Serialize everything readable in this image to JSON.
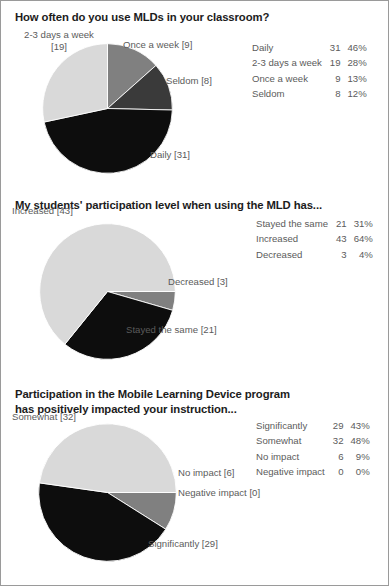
{
  "page": {
    "background": "#ffffff",
    "border_color": "#9a9a9a"
  },
  "palette": {
    "black": "#0d0d0d",
    "dark_gray": "#3a3a3a",
    "mid_gray": "#808080",
    "light_gray": "#d9d9d9",
    "slice_edge": "#ffffff",
    "title_color": "#1c1c1c",
    "label_color": "#5b5b5b"
  },
  "sections": [
    {
      "id": "section-0",
      "title": "How often do you use MLDs in your classroom?",
      "labels": [
        {
          "id": "lbl-0-0",
          "text": "Once a week  [9]",
          "align": "c-right"
        },
        {
          "id": "lbl-0-1",
          "text": "Seldom  [8]",
          "align": "c-right"
        },
        {
          "id": "lbl-0-2",
          "text": "Daily [31]",
          "align": "c-right"
        },
        {
          "id": "lbl-0-3",
          "text": "2-3 days a week\n[19]",
          "align": "c-center"
        }
      ],
      "table": {
        "rows": [
          {
            "label": "Daily",
            "count": "31",
            "percent": "46%"
          },
          {
            "label": "2-3 days a week",
            "count": "19",
            "percent": "28%"
          },
          {
            "label": "Once a week",
            "count": "9",
            "percent": "13%"
          },
          {
            "label": "Seldom",
            "count": "8",
            "percent": "12%"
          }
        ]
      }
    },
    {
      "id": "section-1",
      "title": "My students' participation level when using the MLD has...",
      "labels": [
        {
          "id": "lbl-1-0",
          "text": "Increased [43]",
          "align": "c-left"
        },
        {
          "id": "lbl-1-1",
          "text": "Decreased  [3]",
          "align": "c-right"
        },
        {
          "id": "lbl-1-2",
          "text": "Stayed the same  [21]",
          "align": "c-right"
        }
      ],
      "table": {
        "rows": [
          {
            "label": "Stayed the same",
            "count": "21",
            "percent": "31%"
          },
          {
            "label": "Increased",
            "count": "43",
            "percent": "64%"
          },
          {
            "label": "Decreased",
            "count": "3",
            "percent": "4%"
          }
        ]
      }
    },
    {
      "id": "section-2",
      "title": "Participation in the Mobile Learning Device program\nhas positively impacted your instruction...",
      "labels": [
        {
          "id": "lbl-2-0",
          "text": "Somewhat [32]",
          "align": "c-left"
        },
        {
          "id": "lbl-2-1",
          "text": "No impact  [6]",
          "align": "c-right"
        },
        {
          "id": "lbl-2-2",
          "text": "Negative impact  [0]",
          "align": "c-right"
        },
        {
          "id": "lbl-2-3",
          "text": "Significantly  [29]",
          "align": "c-right"
        }
      ],
      "table": {
        "rows": [
          {
            "label": "Significantly",
            "count": "29",
            "percent": "43%"
          },
          {
            "label": "Somewhat",
            "count": "32",
            "percent": "48%"
          },
          {
            "label": "No impact",
            "count": "6",
            "percent": "9%"
          },
          {
            "label": "Negative impact",
            "count": "0",
            "percent": "0%"
          }
        ]
      }
    }
  ],
  "chart_data": [
    {
      "type": "pie",
      "title": "How often do you use MLDs in your classroom?",
      "total": 67,
      "start_angle_deg": -90,
      "direction": "clockwise",
      "categories": [
        "Once a week",
        "Seldom",
        "Daily",
        "2-3 days a week"
      ],
      "values": [
        9,
        8,
        31,
        19
      ],
      "percents": [
        13,
        12,
        46,
        28
      ],
      "colors": [
        "#808080",
        "#3a3a3a",
        "#0d0d0d",
        "#d9d9d9"
      ],
      "legend": "table-right"
    },
    {
      "type": "pie",
      "title": "My students' participation level when using the MLD has...",
      "total": 67,
      "start_angle_deg": 0,
      "direction": "clockwise",
      "categories": [
        "Decreased",
        "Stayed the same",
        "Increased"
      ],
      "values": [
        3,
        21,
        43
      ],
      "percents": [
        4,
        31,
        64
      ],
      "colors": [
        "#808080",
        "#0d0d0d",
        "#d9d9d9"
      ],
      "legend": "table-right"
    },
    {
      "type": "pie",
      "title": "Participation in the Mobile Learning Device program has positively impacted your instruction...",
      "total": 67,
      "start_angle_deg": 0,
      "direction": "clockwise",
      "categories": [
        "Negative impact",
        "No impact",
        "Significantly",
        "Somewhat"
      ],
      "values": [
        0,
        6,
        29,
        32
      ],
      "percents": [
        0,
        9,
        43,
        48
      ],
      "colors": [
        "#3a3a3a",
        "#808080",
        "#0d0d0d",
        "#d9d9d9"
      ],
      "legend": "table-right"
    }
  ]
}
